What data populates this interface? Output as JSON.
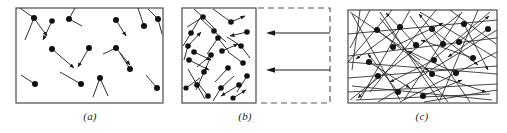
{
  "figure": {
    "type": "physics-diagram",
    "width": 507,
    "height": 133,
    "background_color": "#ffffff",
    "ink_color": "#1a1a1a",
    "box_stroke_color": "#4a4a4a"
  },
  "panels": [
    {
      "id": "a",
      "caption": "(a)",
      "caption_x": 70,
      "caption_y": 112,
      "box": {
        "x": 16,
        "y": 8,
        "w": 147,
        "h": 95
      },
      "box_style": "solid",
      "state": "gas at initial volume, low molecular speeds",
      "molecule_count": 18,
      "molecules": [
        {
          "x": 34,
          "y": 18,
          "dx": -14,
          "dy": -10
        },
        {
          "x": 34,
          "y": 18,
          "dx": -9,
          "dy": 22
        },
        {
          "x": 52,
          "y": 21,
          "dx": 13,
          "dy": 18
        },
        {
          "x": 69,
          "y": 19,
          "dx": 6,
          "dy": -11
        },
        {
          "x": 69,
          "y": 19,
          "dx": 13,
          "dy": 7
        },
        {
          "x": 116,
          "y": 20,
          "dx": 10,
          "dy": 16
        },
        {
          "x": 144,
          "y": 26,
          "dx": -6,
          "dy": -18
        },
        {
          "x": 158,
          "y": 19,
          "dx": -10,
          "dy": -10
        },
        {
          "x": 52,
          "y": 49,
          "dx": -13,
          "dy": 6
        },
        {
          "x": 52,
          "y": 49,
          "dx": 22,
          "dy": 19
        },
        {
          "x": 89,
          "y": 48,
          "dx": -11,
          "dy": 19
        },
        {
          "x": 116,
          "y": 48,
          "dx": -13,
          "dy": 6
        },
        {
          "x": 116,
          "y": 48,
          "dx": 14,
          "dy": 17
        },
        {
          "x": 130,
          "y": 69,
          "dx": -10,
          "dy": -16
        },
        {
          "x": 35,
          "y": 84,
          "dx": -14,
          "dy": -9
        },
        {
          "x": 81,
          "y": 84,
          "dx": -21,
          "dy": -12
        },
        {
          "x": 100,
          "y": 78,
          "dx": 8,
          "dy": 18
        },
        {
          "x": 157,
          "y": 88,
          "dx": -11,
          "dy": -13
        }
      ]
    },
    {
      "id": "b",
      "caption": "(b)",
      "caption_x": 225,
      "caption_y": 112,
      "box": {
        "x": 182,
        "y": 8,
        "w": 74,
        "h": 95
      },
      "box_style": "solid",
      "dashed_region": {
        "x": 258,
        "y": 8,
        "w": 72,
        "h": 95
      },
      "dashed_region_style": "dashed",
      "state": "gas being compressed; piston moves left",
      "compression_arrows": [
        {
          "x_start": 330,
          "x_end": 268,
          "y": 33,
          "direction": "left"
        },
        {
          "x_start": 330,
          "x_end": 268,
          "y": 70,
          "direction": "left"
        }
      ],
      "molecule_count": 22,
      "molecules": [
        {
          "x": 203,
          "y": 17,
          "dx": -16,
          "dy": 10
        },
        {
          "x": 203,
          "y": 17,
          "dx": -9,
          "dy": -8
        },
        {
          "x": 231,
          "y": 22,
          "dx": -18,
          "dy": -13
        },
        {
          "x": 231,
          "y": 22,
          "dx": 14,
          "dy": -6
        },
        {
          "x": 191,
          "y": 33,
          "dx": 9,
          "dy": -15
        },
        {
          "x": 214,
          "y": 31,
          "dx": -14,
          "dy": -13
        },
        {
          "x": 247,
          "y": 32,
          "dx": -17,
          "dy": 4
        },
        {
          "x": 188,
          "y": 46,
          "dx": 13,
          "dy": -14
        },
        {
          "x": 218,
          "y": 38,
          "dx": -11,
          "dy": 16
        },
        {
          "x": 241,
          "y": 46,
          "dx": -14,
          "dy": -9
        },
        {
          "x": 194,
          "y": 52,
          "dx": 17,
          "dy": 8
        },
        {
          "x": 222,
          "y": 51,
          "dx": 16,
          "dy": -7
        },
        {
          "x": 189,
          "y": 60,
          "dx": 20,
          "dy": 10
        },
        {
          "x": 211,
          "y": 55,
          "dx": -14,
          "dy": 12
        },
        {
          "x": 243,
          "y": 63,
          "dx": -15,
          "dy": -11
        },
        {
          "x": 228,
          "y": 68,
          "dx": -13,
          "dy": 14
        },
        {
          "x": 204,
          "y": 72,
          "dx": 8,
          "dy": -18
        },
        {
          "x": 247,
          "y": 76,
          "dx": -10,
          "dy": 16
        },
        {
          "x": 197,
          "y": 85,
          "dx": -9,
          "dy": -16
        },
        {
          "x": 221,
          "y": 88,
          "dx": 13,
          "dy": -12
        },
        {
          "x": 239,
          "y": 85,
          "dx": -18,
          "dy": 11
        },
        {
          "x": 208,
          "y": 96,
          "dx": -11,
          "dy": -14
        }
      ]
    },
    {
      "id": "c",
      "caption": "(c)",
      "caption_x": 402,
      "caption_y": 112,
      "box": {
        "x": 348,
        "y": 10,
        "w": 149,
        "h": 93
      },
      "box_style": "solid",
      "state": "compressed gas; molecular speeds increased, longer vectors",
      "molecule_count": 17,
      "molecules": [
        {
          "x": 377,
          "y": 30,
          "dx": -22,
          "dy": -19
        },
        {
          "x": 377,
          "y": 30,
          "dx": 52,
          "dy": 41
        },
        {
          "x": 400,
          "y": 27,
          "dx": -44,
          "dy": 32
        },
        {
          "x": 432,
          "y": 29,
          "dx": -12,
          "dy": -20
        },
        {
          "x": 432,
          "y": 29,
          "dx": 46,
          "dy": 36
        },
        {
          "x": 464,
          "y": 24,
          "dx": 24,
          "dy": 46
        },
        {
          "x": 488,
          "y": 29,
          "dx": -40,
          "dy": 28
        },
        {
          "x": 393,
          "y": 47,
          "dx": 50,
          "dy": -24
        },
        {
          "x": 416,
          "y": 45,
          "dx": -30,
          "dy": -32
        },
        {
          "x": 443,
          "y": 44,
          "dx": -24,
          "dy": -34
        },
        {
          "x": 459,
          "y": 42,
          "dx": 30,
          "dy": -28
        },
        {
          "x": 434,
          "y": 60,
          "dx": -44,
          "dy": 22
        },
        {
          "x": 473,
          "y": 58,
          "dx": -52,
          "dy": -18
        },
        {
          "x": 456,
          "y": 73,
          "dx": -48,
          "dy": -22
        },
        {
          "x": 432,
          "y": 74,
          "dx": 54,
          "dy": 18
        },
        {
          "x": 378,
          "y": 76,
          "dx": -20,
          "dy": 22
        },
        {
          "x": 398,
          "y": 92,
          "dx": -30,
          "dy": -38
        }
      ],
      "background_trajectories": 26
    }
  ]
}
